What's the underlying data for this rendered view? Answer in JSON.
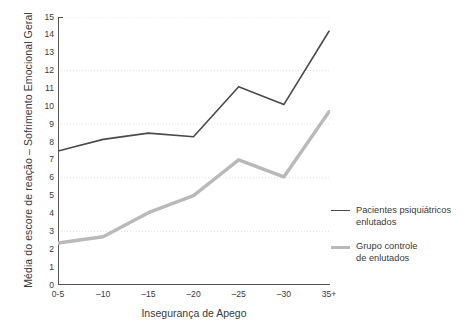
{
  "chart_data": {
    "type": "line",
    "title": "",
    "xlabel": "Insegurança de Apego",
    "ylabel": "Média do escore de reação – Sofrimento Emocional Geral",
    "categories": [
      "0-5",
      "–10",
      "–15",
      "–20",
      "–25",
      "–30",
      "35+"
    ],
    "ylim": [
      0,
      15
    ],
    "yticks": [
      0,
      1,
      2,
      3,
      4,
      5,
      6,
      7,
      8,
      9,
      10,
      11,
      12,
      13,
      14,
      15
    ],
    "ytick_labels": [
      "0",
      "1",
      "2",
      "3",
      "4",
      "5",
      "6",
      "7",
      "8",
      "9",
      "10",
      "11",
      "12",
      "13",
      "14",
      "15"
    ],
    "gridlines_y": [
      3,
      6,
      9,
      12,
      15
    ],
    "grid": true,
    "legend_position": "right",
    "series": [
      {
        "name": "Pacientes psiquiátricos enlutados",
        "name_line1": "Pacientes psiquiátricos",
        "name_line2": "enlutados",
        "color": "#4a4a4a",
        "width": 1.6,
        "values": [
          7.5,
          8.15,
          8.5,
          8.3,
          11.1,
          10.1,
          14.2
        ]
      },
      {
        "name": "Grupo controle de enlutados",
        "name_line1": "Grupo controle",
        "name_line2": "de enlutados",
        "color": "#b9b9b9",
        "width": 3.4,
        "values": [
          2.35,
          2.7,
          4.05,
          5.0,
          7.0,
          6.05,
          9.7
        ]
      }
    ]
  },
  "axes": {
    "axis_color": "#555555",
    "grid_color": "#e2e2e2",
    "background": "#ffffff"
  }
}
